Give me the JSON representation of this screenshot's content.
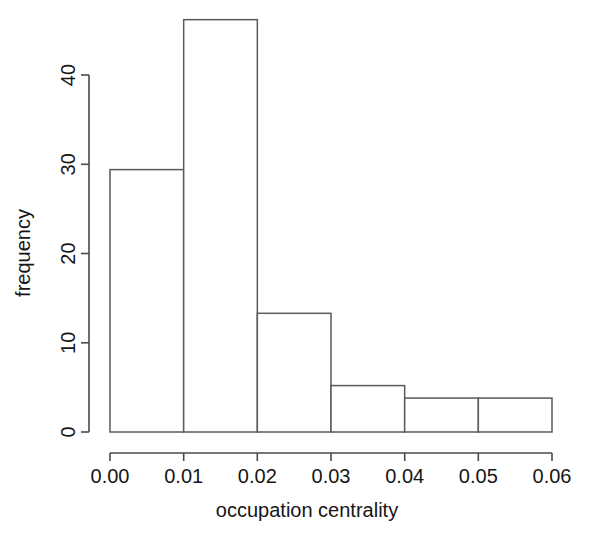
{
  "chart_data": {
    "type": "bar",
    "title": "",
    "subtitle": "",
    "xlabel": "occupation centrality",
    "ylabel": "frequency",
    "grid": false,
    "legend": false,
    "legend_position": "none",
    "bin_width": 0.01,
    "bin_edges": [
      0.0,
      0.01,
      0.02,
      0.03,
      0.04,
      0.05,
      0.06
    ],
    "categories": [
      "0.00-0.01",
      "0.01-0.02",
      "0.02-0.03",
      "0.03-0.04",
      "0.04-0.05",
      "0.05-0.06"
    ],
    "values": [
      29.4,
      46.2,
      13.3,
      5.2,
      3.8,
      3.8
    ],
    "xlim": [
      0.0,
      0.06
    ],
    "ylim": [
      0,
      46.5
    ],
    "x_ticks": [
      0.0,
      0.01,
      0.02,
      0.03,
      0.04,
      0.05,
      0.06
    ],
    "x_tick_labels": [
      "0.00",
      "0.01",
      "0.02",
      "0.03",
      "0.04",
      "0.05",
      "0.06"
    ],
    "y_ticks": [
      0,
      10,
      20,
      30,
      40
    ],
    "y_tick_labels": [
      "0",
      "10",
      "20",
      "30",
      "40"
    ],
    "colors": {
      "bar_fill": "#ffffff",
      "bar_stroke": "#5a5a5a",
      "axis": "#4a4a4a",
      "text": "#161616",
      "background": "#ffffff"
    }
  },
  "axes": {
    "x_title": "occupation centrality",
    "y_title": "frequency"
  },
  "x_tick_labels": [
    "0.00",
    "0.01",
    "0.02",
    "0.03",
    "0.04",
    "0.05",
    "0.06"
  ],
  "y_tick_labels": [
    "0",
    "10",
    "20",
    "30",
    "40"
  ]
}
